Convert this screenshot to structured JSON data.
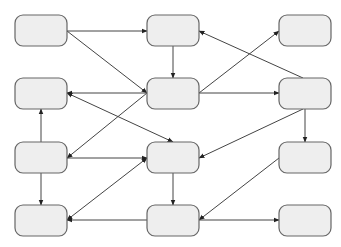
{
  "diagram": {
    "type": "flow-graph",
    "colors": {
      "background": "#ffffff",
      "node_fill": "#eeeeee",
      "node_stroke": "#666666",
      "edge": "#444444"
    },
    "node_size": {
      "w": 52,
      "h": 31,
      "rx": 8
    },
    "nodes": [
      {
        "id": "n1",
        "row": 1,
        "col": 1,
        "x": 15,
        "y": 15,
        "label": ""
      },
      {
        "id": "n2",
        "row": 1,
        "col": 2,
        "x": 147,
        "y": 15,
        "label": ""
      },
      {
        "id": "n3",
        "row": 1,
        "col": 3,
        "x": 279,
        "y": 15,
        "label": ""
      },
      {
        "id": "n4",
        "row": 2,
        "col": 1,
        "x": 15,
        "y": 78,
        "label": ""
      },
      {
        "id": "n5",
        "row": 2,
        "col": 2,
        "x": 147,
        "y": 78,
        "label": ""
      },
      {
        "id": "n6",
        "row": 2,
        "col": 3,
        "x": 279,
        "y": 78,
        "label": ""
      },
      {
        "id": "n7",
        "row": 3,
        "col": 1,
        "x": 15,
        "y": 142,
        "label": ""
      },
      {
        "id": "n8",
        "row": 3,
        "col": 2,
        "x": 147,
        "y": 142,
        "label": ""
      },
      {
        "id": "n9",
        "row": 3,
        "col": 3,
        "x": 279,
        "y": 142,
        "label": ""
      },
      {
        "id": "n10",
        "row": 4,
        "col": 1,
        "x": 15,
        "y": 205,
        "label": ""
      },
      {
        "id": "n11",
        "row": 4,
        "col": 2,
        "x": 147,
        "y": 205,
        "label": ""
      },
      {
        "id": "n12",
        "row": 4,
        "col": 3,
        "x": 279,
        "y": 205,
        "label": ""
      }
    ],
    "edges": [
      {
        "from": "n1",
        "to": "n2",
        "x1": 67,
        "y1": 31,
        "x2": 147,
        "y2": 31,
        "arrow_end": true,
        "arrow_start": false
      },
      {
        "from": "n1",
        "to": "n5",
        "x1": 67,
        "y1": 31,
        "x2": 147,
        "y2": 93,
        "arrow_end": true,
        "arrow_start": false
      },
      {
        "from": "n2",
        "to": "n5",
        "x1": 173,
        "y1": 46,
        "x2": 173,
        "y2": 78,
        "arrow_end": true,
        "arrow_start": false
      },
      {
        "from": "n6",
        "to": "n2",
        "x1": 303,
        "y1": 78,
        "x2": 199,
        "y2": 31,
        "arrow_end": true,
        "arrow_start": false
      },
      {
        "from": "n5",
        "to": "n3",
        "x1": 199,
        "y1": 93,
        "x2": 279,
        "y2": 31,
        "arrow_end": true,
        "arrow_start": false
      },
      {
        "from": "n5",
        "to": "n4",
        "x1": 147,
        "y1": 93,
        "x2": 67,
        "y2": 93,
        "arrow_end": true,
        "arrow_start": false
      },
      {
        "from": "n5",
        "to": "n6",
        "x1": 199,
        "y1": 93,
        "x2": 279,
        "y2": 93,
        "arrow_end": true,
        "arrow_start": false
      },
      {
        "from": "n4",
        "to": "n8",
        "x1": 67,
        "y1": 93,
        "x2": 173,
        "y2": 142,
        "arrow_end": true,
        "arrow_start": true
      },
      {
        "from": "n5",
        "to": "n7",
        "x1": 147,
        "y1": 93,
        "x2": 67,
        "y2": 158,
        "arrow_end": true,
        "arrow_start": false
      },
      {
        "from": "n7",
        "to": "n4",
        "x1": 41,
        "y1": 142,
        "x2": 41,
        "y2": 109,
        "arrow_end": true,
        "arrow_start": false
      },
      {
        "from": "n7",
        "to": "n10",
        "x1": 41,
        "y1": 173,
        "x2": 41,
        "y2": 205,
        "arrow_end": true,
        "arrow_start": false
      },
      {
        "from": "n7",
        "to": "n8",
        "x1": 67,
        "y1": 158,
        "x2": 147,
        "y2": 158,
        "arrow_end": true,
        "arrow_start": false
      },
      {
        "from": "n6",
        "to": "n8",
        "x1": 303,
        "y1": 109,
        "x2": 199,
        "y2": 158,
        "arrow_end": true,
        "arrow_start": false
      },
      {
        "from": "n6",
        "to": "n9",
        "x1": 305,
        "y1": 109,
        "x2": 305,
        "y2": 142,
        "arrow_end": true,
        "arrow_start": false
      },
      {
        "from": "n8",
        "to": "n11",
        "x1": 173,
        "y1": 173,
        "x2": 173,
        "y2": 205,
        "arrow_end": true,
        "arrow_start": false
      },
      {
        "from": "n10",
        "to": "n8",
        "x1": 67,
        "y1": 220,
        "x2": 147,
        "y2": 158,
        "arrow_end": true,
        "arrow_start": true
      },
      {
        "from": "n11",
        "to": "n10",
        "x1": 147,
        "y1": 220,
        "x2": 67,
        "y2": 220,
        "arrow_end": true,
        "arrow_start": false
      },
      {
        "from": "n9",
        "to": "n11",
        "x1": 279,
        "y1": 158,
        "x2": 199,
        "y2": 220,
        "arrow_end": true,
        "arrow_start": false
      },
      {
        "from": "n11",
        "to": "n12",
        "x1": 199,
        "y1": 220,
        "x2": 279,
        "y2": 220,
        "arrow_end": true,
        "arrow_start": false
      }
    ]
  }
}
